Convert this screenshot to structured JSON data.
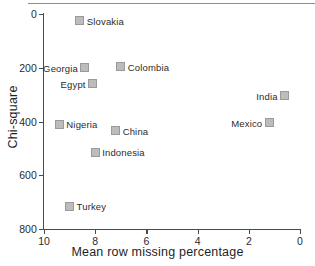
{
  "chart_data": {
    "type": "scatter",
    "title": "",
    "xlabel": "Mean row missing percentage",
    "ylabel": "Chi-square",
    "xlim": [
      10,
      0
    ],
    "ylim": [
      800,
      0
    ],
    "x_reversed": true,
    "y_reversed": true,
    "grid": false,
    "legend": "none",
    "xticks": [
      "10",
      "8",
      "6",
      "4",
      "2",
      "0"
    ],
    "xtick_values": [
      10,
      8,
      6,
      4,
      2,
      0
    ],
    "yticks": [
      "0",
      "200",
      "400",
      "600",
      "800"
    ],
    "ytick_values": [
      0,
      200,
      400,
      600,
      800
    ],
    "marker": "square",
    "marker_color": "#bcbcbc",
    "marker_edge_color": "#9a9a9a",
    "points": [
      {
        "label": "Slovakia",
        "x": 8.6,
        "y": 26,
        "label_side": "right"
      },
      {
        "label": "Georgia",
        "x": 8.4,
        "y": 200,
        "label_side": "left"
      },
      {
        "label": "Colombia",
        "x": 7.0,
        "y": 196,
        "label_side": "right"
      },
      {
        "label": "Egypt",
        "x": 8.1,
        "y": 260,
        "label_side": "left"
      },
      {
        "label": "India",
        "x": 0.6,
        "y": 305,
        "label_side": "left"
      },
      {
        "label": "Nigeria",
        "x": 9.4,
        "y": 410,
        "label_side": "right"
      },
      {
        "label": "Mexico",
        "x": 1.2,
        "y": 405,
        "label_side": "left"
      },
      {
        "label": "China",
        "x": 7.2,
        "y": 435,
        "label_side": "right"
      },
      {
        "label": "Indonesia",
        "x": 8.0,
        "y": 515,
        "label_side": "right"
      },
      {
        "label": "Turkey",
        "x": 9.0,
        "y": 715,
        "label_side": "right"
      }
    ]
  }
}
